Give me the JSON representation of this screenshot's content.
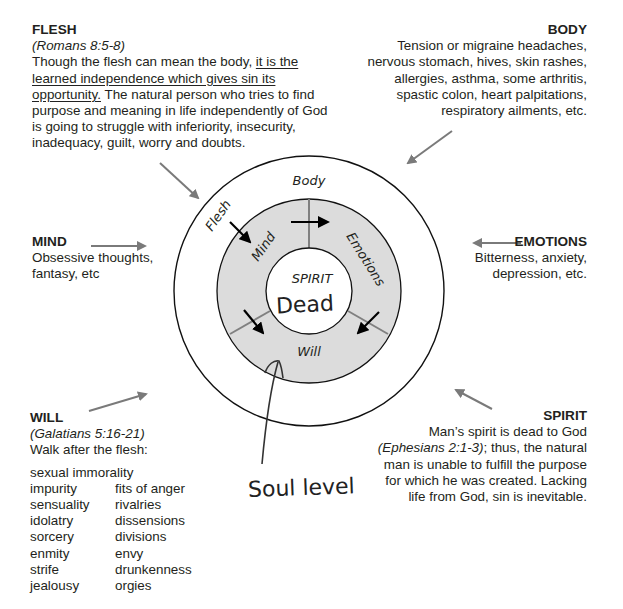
{
  "flesh": {
    "title": "FLESH",
    "reference": "(Romans 8:5-8)",
    "text_before": "Though the flesh can mean the body, ",
    "text_underlined": "it is the learned independence which gives sin its opportunity.",
    "text_after": " The natural person who tries to find purpose and meaning in life independently of God is going to struggle with inferiority, insecurity, inadequacy, guilt, worry and doubts."
  },
  "body": {
    "title": "BODY",
    "lines": [
      "Tension or migraine headaches,",
      "nervous stomach, hives, skin rashes,",
      "allergies, asthma, some arthritis,",
      "spastic colon, heart palpitations,",
      "respiratory ailments, etc."
    ]
  },
  "mind": {
    "title": "MIND",
    "lines": [
      "Obsessive thoughts,",
      "fantasy, etc"
    ]
  },
  "emotions": {
    "title": "EMOTIONS",
    "lines": [
      "Bitterness, anxiety,",
      "depression, etc."
    ]
  },
  "will": {
    "title": "WILL",
    "reference": "(Galatians 5:16-21)",
    "intro": "Walk after the flesh:",
    "list_full": "sexual immorality",
    "list_left": [
      "impurity",
      "sensuality",
      "idolatry",
      "sorcery",
      "enmity",
      "strife",
      "jealousy"
    ],
    "list_right": [
      "fits of anger",
      "rivalries",
      "dissensions",
      "divisions",
      "envy",
      "drunkenness",
      "orgies"
    ]
  },
  "spirit": {
    "title": "SPIRIT",
    "line1": "Man’s spirit is dead to God",
    "reference": "(Ephesians  2:1-3)",
    "line2_rest": "; thus, the natural",
    "lines": [
      "man is unable to fulfill the purpose",
      "for which he was created. Lacking",
      "life from God, sin is inevitable."
    ]
  },
  "diagram": {
    "outer_ring_labels": {
      "body": "Body",
      "flesh": "Flesh"
    },
    "soul_labels": {
      "mind": "Mind",
      "emotions": "Emotions",
      "will": "Will"
    },
    "center_label": "SPIRIT",
    "handwritten_center": "Dead",
    "handwritten_annotation": "Soul level",
    "colors": {
      "soul_fill": "#dcdcdc",
      "pointer_arrows": "#7a7a7a",
      "flow_arrows": "#000000",
      "divider": "#808080"
    }
  }
}
